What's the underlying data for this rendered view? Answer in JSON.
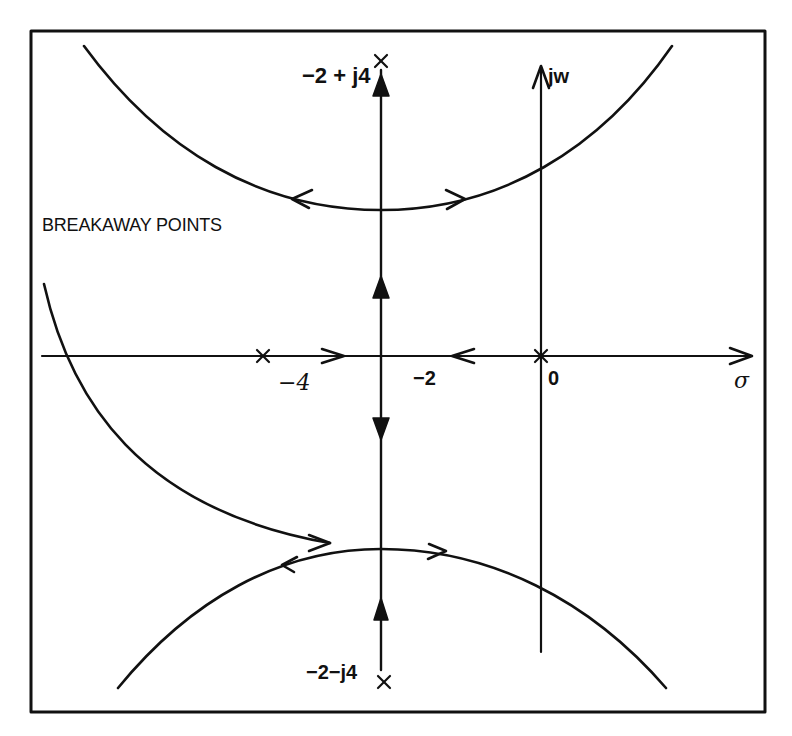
{
  "figure": {
    "type": "root-locus",
    "frame": {
      "x": 30,
      "y": 30,
      "width": 735,
      "height": 682
    },
    "line_color": "#111111",
    "background": "#ffffff"
  },
  "labels": {
    "upper_pole": "−2 + j4",
    "imag_axis": "jw",
    "breakaway": "BREAKAWAY POINTS",
    "real_minus_4": "−4",
    "real_minus_2": "−2",
    "origin": "0",
    "real_axis": "σ",
    "lower_pole": "−2−j4"
  },
  "poles": [
    {
      "name": "pole-origin",
      "re": 0,
      "im": 0
    },
    {
      "name": "pole-minus-4",
      "re": -4,
      "im": 0
    },
    {
      "name": "pole-upper",
      "re": -2,
      "im": 4
    },
    {
      "name": "pole-lower",
      "re": -2,
      "im": -4
    }
  ],
  "axes": {
    "real_axis_label": "σ",
    "imag_axis_label": "jw",
    "real_ticks": [
      "−4",
      "−2",
      "0"
    ]
  },
  "branches": [
    {
      "name": "real-axis-from-minus-4",
      "direction": "toward −2"
    },
    {
      "name": "real-axis-from-origin",
      "direction": "toward −2"
    },
    {
      "name": "vertical-up",
      "direction": "from real axis upward to −2 + j4"
    },
    {
      "name": "vertical-down",
      "direction": "from real axis downward to −2 − j4"
    },
    {
      "name": "upper-curve",
      "direction": "outward from upper breakaway point"
    },
    {
      "name": "lower-curve",
      "direction": "outward from lower breakaway point"
    },
    {
      "name": "left-curve",
      "direction": "into lower breakaway point"
    }
  ]
}
